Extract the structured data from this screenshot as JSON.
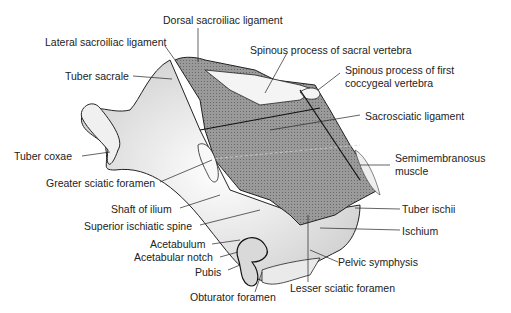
{
  "diagram": {
    "labels": {
      "dorsal_sacroiliac": "Dorsal sacroiliac ligament",
      "lateral_sacroiliac": "Lateral sacroiliac ligament",
      "tuber_sacrale": "Tuber sacrale",
      "spinous_sacral": "Spinous process of sacral vertebra",
      "spinous_coccygeal_1": "Spinous process of first",
      "spinous_coccygeal_2": "coccygeal vertebra",
      "sacrosciatic": "Sacrosciatic ligament",
      "tuber_coxae": "Tuber coxae",
      "greater_sciatic": "Greater sciatic foramen",
      "semimembranosus_1": "Semimembranosus",
      "semimembranosus_2": "muscle",
      "shaft_ilium": "Shaft of ilium",
      "superior_ischiatic": "Superior ischiatic spine",
      "tuber_ischii": "Tuber ischii",
      "acetabulum": "Acetabulum",
      "ischium": "Ischium",
      "acetabular_notch": "Acetabular notch",
      "pubis": "Pubis",
      "pelvic_symphysis": "Pelvic symphysis",
      "lesser_sciatic": "Lesser sciatic foramen",
      "obturator": "Obturator foramen"
    },
    "colors": {
      "ligament": "#8a8a8a",
      "bone_shade": "#d8d8d8",
      "line": "#1a1a1a"
    }
  }
}
